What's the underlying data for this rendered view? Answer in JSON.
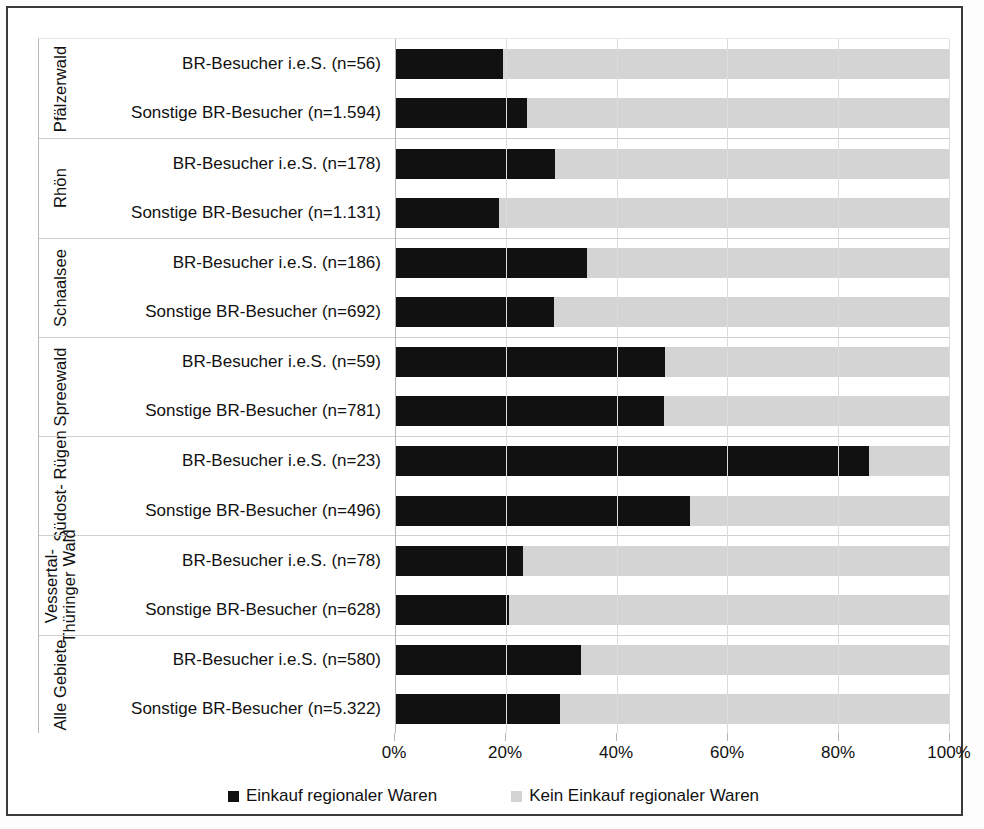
{
  "chart_data": {
    "type": "bar",
    "orientation": "horizontal",
    "stacked": true,
    "stacked_percent": true,
    "title": "",
    "subtitle": "",
    "xlabel": "",
    "ylabel": "",
    "xlim": [
      0,
      100
    ],
    "xtick_labels": [
      "0%",
      "20%",
      "40%",
      "60%",
      "80%",
      "100%"
    ],
    "xticks": [
      0,
      20,
      40,
      60,
      80,
      100
    ],
    "grid": "vertical",
    "legend_position": "bottom-center",
    "legend": [
      {
        "label": "Einkauf regionaler Waren",
        "color": "#111111",
        "swatch": "dark"
      },
      {
        "label": "Kein Einkauf regionaler Waren",
        "color": "#d4d4d4",
        "swatch": "light"
      }
    ],
    "series": [
      {
        "name": "Einkauf regionaler Waren",
        "color": "#111111",
        "values": [
          19.5,
          23.8,
          28.9,
          18.8,
          34.6,
          28.7,
          48.7,
          48.5,
          85.5,
          53.2,
          23.1,
          20.6,
          33.6,
          29.8
        ]
      },
      {
        "name": "Kein Einkauf regionaler Waren",
        "color": "#d4d4d4",
        "values": [
          80.5,
          76.2,
          71.1,
          81.2,
          65.4,
          71.3,
          51.3,
          51.5,
          14.5,
          46.8,
          76.9,
          79.4,
          66.4,
          70.2
        ]
      }
    ],
    "categories": [
      "BR-Besucher i.e.S. (n=56)",
      "Sonstige BR-Besucher (n=1.594)",
      "BR-Besucher i.e.S. (n=178)",
      "Sonstige BR-Besucher (n=1.131)",
      "BR-Besucher i.e.S. (n=186)",
      "Sonstige BR-Besucher (n=692)",
      "BR-Besucher i.e.S. (n=59)",
      "Sonstige BR-Besucher (n=781)",
      "BR-Besucher i.e.S. (n=23)",
      "Sonstige BR-Besucher (n=496)",
      "BR-Besucher i.e.S. (n=78)",
      "Sonstige BR-Besucher (n=628)",
      "BR-Besucher i.e.S. (n=580)",
      "Sonstige BR-Besucher (n=5.322)"
    ],
    "groups": [
      {
        "name": "Pfälzerwald",
        "rows": [
          {
            "label": "BR-Besucher i.e.S. (n=56)",
            "dark": 19.5,
            "light": 80.5
          },
          {
            "label": "Sonstige BR-Besucher (n=1.594)",
            "dark": 23.8,
            "light": 76.2
          }
        ]
      },
      {
        "name": "Rhön",
        "rows": [
          {
            "label": "BR-Besucher i.e.S. (n=178)",
            "dark": 28.9,
            "light": 71.1
          },
          {
            "label": "Sonstige BR-Besucher (n=1.131)",
            "dark": 18.8,
            "light": 81.2
          }
        ]
      },
      {
        "name": "Schaalsee",
        "rows": [
          {
            "label": "BR-Besucher i.e.S. (n=186)",
            "dark": 34.6,
            "light": 65.4
          },
          {
            "label": "Sonstige BR-Besucher (n=692)",
            "dark": 28.7,
            "light": 71.3
          }
        ]
      },
      {
        "name": "Spreewald",
        "rows": [
          {
            "label": "BR-Besucher i.e.S. (n=59)",
            "dark": 48.7,
            "light": 51.3
          },
          {
            "label": "Sonstige BR-Besucher (n=781)",
            "dark": 48.5,
            "light": 51.5
          }
        ]
      },
      {
        "name": "Südost-\nRügen",
        "rows": [
          {
            "label": "BR-Besucher i.e.S. (n=23)",
            "dark": 85.5,
            "light": 14.5
          },
          {
            "label": "Sonstige BR-Besucher (n=496)",
            "dark": 53.2,
            "light": 46.8
          }
        ]
      },
      {
        "name": "Vessertal-\nThüringer Wald",
        "rows": [
          {
            "label": "BR-Besucher i.e.S. (n=78)",
            "dark": 23.1,
            "light": 76.9
          },
          {
            "label": "Sonstige BR-Besucher (n=628)",
            "dark": 20.6,
            "light": 79.4
          }
        ]
      },
      {
        "name": "Alle\nGebiete",
        "rows": [
          {
            "label": "BR-Besucher i.e.S. (n=580)",
            "dark": 33.6,
            "light": 66.4
          },
          {
            "label": "Sonstige BR-Besucher (n=5.322)",
            "dark": 29.8,
            "light": 70.2
          }
        ]
      }
    ]
  }
}
